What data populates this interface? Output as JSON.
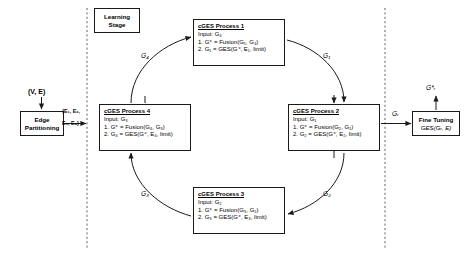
{
  "diagram": {
    "background": "#ffffff",
    "stroke": "#1a1a1a"
  },
  "partition_stage": {
    "input_label": "(V, E)",
    "box_line1": "Edge",
    "box_line2": "Partitioning",
    "output_label_line1": "{E₁, E₂,",
    "output_label_line2": "E₃, E₄}"
  },
  "learning_stage": {
    "label_line1": "Learning",
    "label_line2": "Stage",
    "processes": [
      {
        "id": "proc1",
        "title": "cGES Process 1",
        "input": "Input: G₄",
        "step1": "1. G⁺ = Fusion(G₁, G₄)",
        "step2": "2. G₁ = GES(G⁺, E₁, limit)"
      },
      {
        "id": "proc2",
        "title": "cGES Process 2",
        "input": "Input: G₁",
        "step1": "1. G⁺ = Fusion(G₂, G₁)",
        "step2": "2. G₂ = GES(G⁺, E₂, limit)"
      },
      {
        "id": "proc3",
        "title": "cGES Process 3",
        "input": "Input: G₂",
        "step1": "1. G⁺ = Fusion(G₃, G₂)",
        "step2": "2. G₃ = GES(G⁺, E₃, limit)"
      },
      {
        "id": "proc4",
        "title": "cGES Process 4",
        "input": "Input: G₃",
        "step1": "1. G⁺ = Fusion(G₄, G₃)",
        "step2": "2. G₄ = GES(G⁺, E₄, limit)"
      }
    ],
    "edge_labels": {
      "to_proc1": "G₄",
      "to_proc2": "G₁",
      "to_proc3": "G₂",
      "to_proc4": "G₃"
    }
  },
  "fine_tuning_stage": {
    "input_label": "Gᵣ",
    "box_title": "Fine Tuning",
    "box_formula": "GES(Gᵣ, E)",
    "output_label": "G*ᵣ"
  }
}
